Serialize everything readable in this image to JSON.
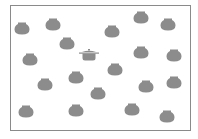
{
  "puzzle": {
    "type": "find-the-odd-one-out",
    "fill_color": "#8c8c8c",
    "border_color": "#8a8a8a",
    "jars": [
      {
        "x": 22,
        "y": 28
      },
      {
        "x": 53,
        "y": 24
      },
      {
        "x": 112,
        "y": 31
      },
      {
        "x": 141,
        "y": 17
      },
      {
        "x": 168,
        "y": 24
      },
      {
        "x": 67,
        "y": 43
      },
      {
        "x": 30,
        "y": 59
      },
      {
        "x": 141,
        "y": 52
      },
      {
        "x": 174,
        "y": 55
      },
      {
        "x": 115,
        "y": 69
      },
      {
        "x": 76,
        "y": 77
      },
      {
        "x": 45,
        "y": 84
      },
      {
        "x": 98,
        "y": 93
      },
      {
        "x": 146,
        "y": 86
      },
      {
        "x": 174,
        "y": 82
      },
      {
        "x": 26,
        "y": 111
      },
      {
        "x": 76,
        "y": 110
      },
      {
        "x": 132,
        "y": 109
      },
      {
        "x": 167,
        "y": 116
      }
    ],
    "odd_item": {
      "kind": "lidded-pot-icon",
      "x": 89,
      "y": 55
    }
  }
}
